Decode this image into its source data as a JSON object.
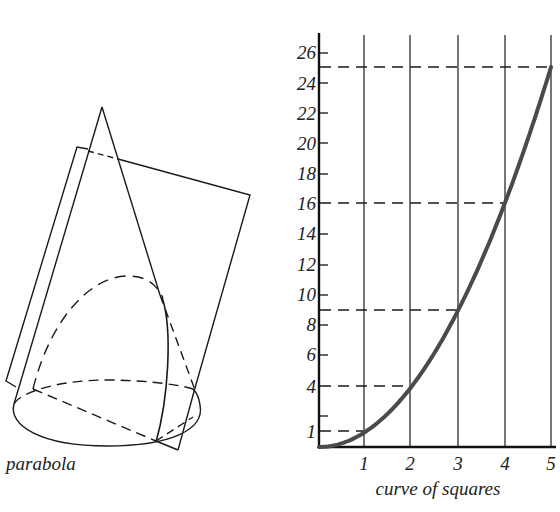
{
  "left_figure": {
    "caption": "parabola",
    "shapes": [
      "cone",
      "cutting-plane",
      "parabola-section",
      "base-ellipse"
    ]
  },
  "right_figure": {
    "caption": "curve of squares"
  },
  "colors": {
    "ink": "#1a1a1a",
    "curve": "#4a4a4a",
    "background": "#ffffff"
  },
  "chart_data": {
    "type": "line",
    "title": "curve of squares",
    "xlabel": "",
    "ylabel": "",
    "x_ticks": [
      "1",
      "2",
      "3",
      "4",
      "5"
    ],
    "y_ticks": [
      "1",
      "4",
      "6",
      "8",
      "10",
      "12",
      "14",
      "16",
      "18",
      "20",
      "22",
      "24",
      "26"
    ],
    "y_tick_positions": [
      1,
      2,
      4,
      6,
      8,
      10,
      12,
      14,
      16,
      18,
      20,
      22,
      24,
      26
    ],
    "xlim": [
      0,
      5
    ],
    "ylim": [
      0,
      27
    ],
    "grid": "vertical lines at x = 1..5",
    "series": [
      {
        "name": "y = x²",
        "x": [
          0,
          1,
          2,
          3,
          4,
          5
        ],
        "values": [
          0,
          1,
          4,
          9,
          16,
          25
        ]
      }
    ],
    "guides": [
      {
        "y": 1,
        "to_x": 1
      },
      {
        "y": 4,
        "to_x": 2
      },
      {
        "y": 9,
        "to_x": 3
      },
      {
        "y": 16,
        "to_x": 4
      },
      {
        "y": 25,
        "to_x": 5
      }
    ]
  }
}
